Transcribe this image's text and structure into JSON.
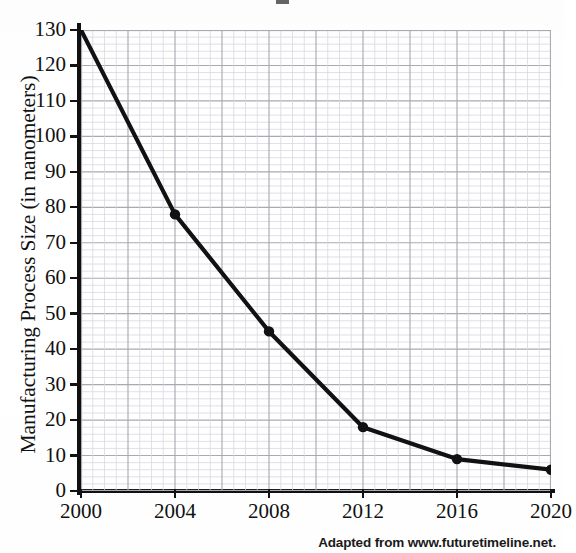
{
  "figure": {
    "name": "manufacturing-process-size-line-chart",
    "caption": "Adapted from www.futuretimeline.net.",
    "y_axis_title": "Manufacturing Process Size (in nanometers)"
  },
  "chart_data": {
    "type": "line",
    "title": "",
    "xlabel": "",
    "ylabel": "Manufacturing Process Size (in nanometers)",
    "x": [
      2000,
      2004,
      2008,
      2012,
      2016,
      2020
    ],
    "values": [
      130,
      78,
      45,
      18,
      9,
      6
    ],
    "series": [
      {
        "name": "Manufacturing process size",
        "values": [
          130,
          78,
          45,
          18,
          9,
          6
        ]
      }
    ],
    "x_tick_labels": [
      "2000",
      "2004",
      "2008",
      "2012",
      "2016",
      "2020"
    ],
    "y_tick_labels": [
      "0",
      "10",
      "20",
      "30",
      "40",
      "50",
      "60",
      "70",
      "80",
      "90",
      "100",
      "110",
      "120",
      "130"
    ],
    "y_ticks": [
      0,
      10,
      20,
      30,
      40,
      50,
      60,
      70,
      80,
      90,
      100,
      110,
      120,
      130
    ],
    "xlim": [
      2000,
      2020
    ],
    "ylim": [
      0,
      130
    ],
    "grid": true,
    "grid_minor_step_y": 2,
    "grid_major_step_y": 10,
    "legend": "none",
    "marker": "filled-circle",
    "line_color": "#111111",
    "grid_color": "#b9b9c2",
    "grid_minor_color": "#d8d8de",
    "annotations": []
  },
  "style": {
    "line_color": "#111111",
    "axis_color": "#101010",
    "grid_major_color": "#a9a9b4",
    "grid_minor_color": "#d6d6dd",
    "text_color": "#111111",
    "background": "#ffffff"
  }
}
